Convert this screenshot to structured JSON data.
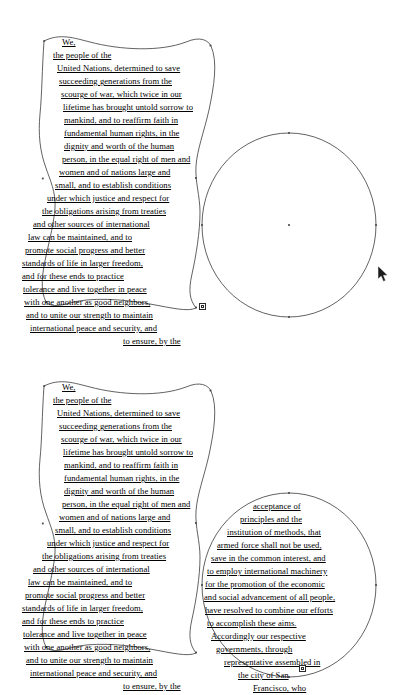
{
  "app": {
    "surface_name": "vector-illustration-canvas",
    "background_color": "#ffffff",
    "stroke_color": "#3a3a3a",
    "text_color": "#000000",
    "anchor_color": "#4a4a4a"
  },
  "panels": [
    {
      "id": "top",
      "label": "before-threading",
      "shapes": [
        {
          "name": "wavy-area-type-path",
          "kind": "area-type-path",
          "filled_with_text": true
        },
        {
          "name": "ellipse-path",
          "kind": "ellipse-path",
          "filled_with_text": false
        }
      ],
      "overflow_marker": {
        "name": "text-overflow-marker",
        "visible": true
      },
      "text_lines": [
        "We,",
        "the people of the",
        "United Nations, determined to save",
        "succeeding generations from the",
        "scourge of war, which twice in our",
        "lifetime has brought untold sorrow to",
        "mankind, and to reaffirm faith in",
        "fundamental human rights, in the",
        "dignity and worth of the human",
        "person, in the equal right of men and",
        "women and of nations large and",
        "small, and to establish conditions",
        "under which justice and respect for",
        "the obligations arising from treaties",
        "and other sources of international",
        "law can be maintained, and to",
        "promote social progress and better",
        "standards of life in larger freedom,",
        "and for these ends to practice",
        "tolerance and live together in peace",
        "with one another as good neighbors,",
        "and to unite our strength to maintain",
        "international peace and security, and",
        "to ensure, by the"
      ],
      "ellipse_text_lines": []
    },
    {
      "id": "bottom",
      "label": "after-threading",
      "shapes": [
        {
          "name": "wavy-area-type-path",
          "kind": "area-type-path",
          "filled_with_text": true
        },
        {
          "name": "ellipse-path",
          "kind": "ellipse-path",
          "filled_with_text": true
        }
      ],
      "overflow_marker": {
        "name": "text-overflow-marker",
        "visible": true
      },
      "text_lines": [
        "We,",
        "the people of the",
        "United Nations, determined to save",
        "succeeding generations from the",
        "scourge of war, which twice in our",
        "lifetime has brought untold sorrow to",
        "mankind, and to reaffirm faith in",
        "fundamental human rights, in the",
        "dignity and worth of the human",
        "person, in the equal right of men and",
        "women and of nations large and",
        "small, and to establish conditions",
        "under which justice and respect for",
        "the obligations arising from treaties",
        "and other sources of international",
        "law can be maintained, and to",
        "promote social progress and better",
        "standards of life in larger freedom,",
        "and for these ends to practice",
        "tolerance and live together in peace",
        "with one another as good neighbors,",
        "and to unite our strength to maintain",
        "international peace and security, and",
        "to ensure, by the"
      ],
      "ellipse_text_lines": [
        "acceptance of",
        "principles and the",
        "institution of methods, that",
        "armed force shall not be used,",
        "save in the common interest, and",
        "to employ international machinery",
        "for the promotion of the economic",
        "and social advancement of all people,",
        "have resolved to combine our efforts",
        "to accomplish these aims.",
        "Accordingly our respective",
        "governments, through",
        "representative assembled in",
        "the city of San",
        "Francisco, who"
      ]
    }
  ],
  "pointer": {
    "name": "mouse-cursor",
    "x": 381,
    "y": 270
  }
}
